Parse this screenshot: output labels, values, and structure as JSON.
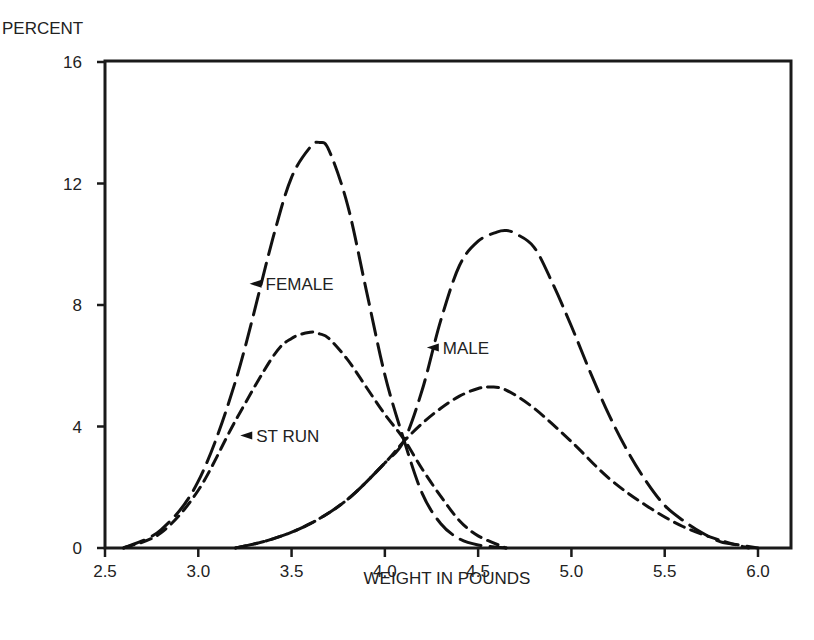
{
  "chart_data": {
    "type": "line",
    "title": "",
    "xlabel": "WEIGHT IN POUNDS",
    "ylabel": "PERCENT",
    "xlim": [
      2.5,
      6.0
    ],
    "ylim": [
      0,
      16
    ],
    "xticks": [
      2.5,
      3.0,
      3.5,
      4.0,
      4.5,
      5.0,
      5.5,
      6.0
    ],
    "xtick_labels": [
      "2.5",
      "3.0",
      "3.5",
      "4.0",
      "4.5",
      "5.0",
      "5.5",
      "6.0"
    ],
    "yticks": [
      0,
      4,
      8,
      12,
      16
    ],
    "ytick_labels": [
      "0",
      "4",
      "8",
      "12",
      "16"
    ],
    "grid": false,
    "legend": "none (inline annotations)",
    "series": [
      {
        "name": "FEMALE",
        "style": "long-dash",
        "x": [
          2.6,
          2.8,
          3.0,
          3.2,
          3.4,
          3.5,
          3.6,
          3.65,
          3.7,
          3.8,
          3.9,
          4.0,
          4.1,
          4.2,
          4.3,
          4.4,
          4.5,
          4.65
        ],
        "y": [
          0.0,
          0.6,
          2.2,
          5.5,
          10.2,
          12.2,
          13.2,
          13.35,
          13.1,
          11.3,
          8.5,
          5.7,
          3.6,
          1.8,
          0.8,
          0.3,
          0.1,
          0.0
        ]
      },
      {
        "name": "ST RUN (female)",
        "style": "short-dash",
        "x": [
          2.6,
          2.8,
          3.0,
          3.2,
          3.4,
          3.5,
          3.6,
          3.65,
          3.7,
          3.8,
          3.9,
          4.0,
          4.1,
          4.2,
          4.3,
          4.4,
          4.5,
          4.65
        ],
        "y": [
          0.0,
          0.5,
          1.9,
          4.2,
          6.3,
          6.9,
          7.1,
          7.05,
          6.9,
          6.2,
          5.3,
          4.4,
          3.6,
          2.6,
          1.7,
          0.9,
          0.4,
          0.0
        ]
      },
      {
        "name": "MALE",
        "style": "long-dash",
        "x": [
          3.2,
          3.4,
          3.6,
          3.8,
          4.0,
          4.1,
          4.2,
          4.3,
          4.4,
          4.5,
          4.6,
          4.65,
          4.7,
          4.8,
          4.9,
          5.0,
          5.1,
          5.2,
          5.3,
          5.4,
          5.5,
          5.6,
          5.7,
          5.8,
          5.9,
          6.0
        ],
        "y": [
          0.0,
          0.3,
          0.8,
          1.6,
          2.8,
          3.5,
          5.2,
          7.5,
          9.3,
          10.1,
          10.4,
          10.45,
          10.35,
          9.9,
          8.7,
          7.3,
          5.8,
          4.4,
          3.2,
          2.2,
          1.4,
          0.9,
          0.5,
          0.2,
          0.1,
          0.0
        ]
      },
      {
        "name": "ST RUN (male)",
        "style": "short-dash",
        "x": [
          3.2,
          3.4,
          3.6,
          3.8,
          4.0,
          4.1,
          4.2,
          4.3,
          4.4,
          4.5,
          4.57,
          4.65,
          4.8,
          5.0,
          5.2,
          5.4,
          5.6,
          5.8,
          5.95
        ],
        "y": [
          0.0,
          0.3,
          0.8,
          1.6,
          2.8,
          3.5,
          4.1,
          4.6,
          5.0,
          5.25,
          5.3,
          5.2,
          4.6,
          3.5,
          2.3,
          1.4,
          0.7,
          0.25,
          0.0
        ]
      }
    ],
    "annotations": [
      {
        "text": "FEMALE",
        "x": 3.35,
        "y": 8.7,
        "arrow": "left"
      },
      {
        "text": "ST RUN",
        "x": 3.3,
        "y": 3.7,
        "arrow": "left"
      },
      {
        "text": "MALE",
        "x": 4.3,
        "y": 6.6,
        "arrow": "left"
      }
    ]
  }
}
